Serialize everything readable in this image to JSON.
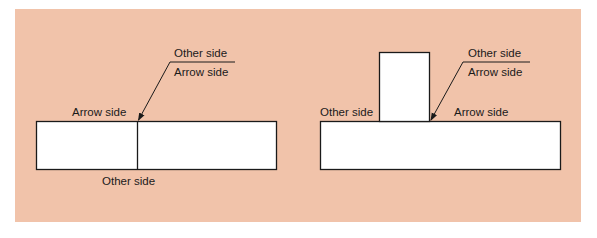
{
  "colors": {
    "background": "#f1c3aa",
    "box_fill": "#ffffff",
    "stroke": "#1a1a1a"
  },
  "left_diagram": {
    "name": "butt-joint",
    "leader_label_top": "Other side",
    "leader_label_bottom": "Arrow side",
    "label_above_joint": "Arrow side",
    "label_below_joint": "Other side"
  },
  "right_diagram": {
    "name": "t-joint",
    "leader_label_top": "Other side",
    "leader_label_bottom": "Arrow side",
    "label_left_of_joint": "Other side",
    "label_right_of_joint": "Arrow side"
  }
}
